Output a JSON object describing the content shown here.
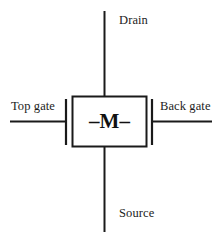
{
  "figure": {
    "kind": "circuit-schematic",
    "background_color": "#ffffff",
    "stroke_color": "#1a1a1a",
    "device_symbol": "–M–",
    "labels": {
      "drain": "Drain",
      "source": "Source",
      "top_gate": "Top gate",
      "back_gate": "Back gate"
    },
    "terminals": [
      {
        "name": "drain",
        "label": "Drain",
        "position": "top"
      },
      {
        "name": "source",
        "label": "Source",
        "position": "bottom"
      },
      {
        "name": "top_gate",
        "label": "Top gate",
        "position": "left"
      },
      {
        "name": "back_gate",
        "label": "Back gate",
        "position": "right"
      }
    ]
  }
}
